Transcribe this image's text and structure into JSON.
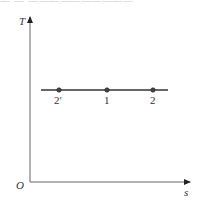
{
  "diagram": {
    "type": "T-s diagram",
    "top_cropped_text": "一 一 一一一一一一一一一一",
    "axes": {
      "y_label": "T",
      "x_label": "s",
      "origin_label": "O"
    },
    "isotherm": {
      "description": "horizontal constant-temperature line",
      "points": [
        {
          "label": "2′",
          "x": 59
        },
        {
          "label": "1",
          "x": 107
        },
        {
          "label": "2",
          "x": 153
        }
      ]
    },
    "colors": {
      "axis": "#555555",
      "line": "#333333",
      "point": "#333333",
      "text": "#333333"
    }
  }
}
